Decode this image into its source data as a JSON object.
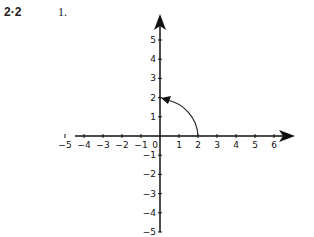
{
  "header": {
    "section": "2·2",
    "problem": "1."
  },
  "chart_data": {
    "type": "line",
    "title": "",
    "xlabel": "",
    "ylabel": "",
    "xlim": [
      -5,
      6
    ],
    "ylim": [
      -5,
      5
    ],
    "x_ticks": [
      -5,
      -4,
      -3,
      -2,
      -1,
      0,
      1,
      2,
      3,
      4,
      5,
      6
    ],
    "y_ticks": [
      -5,
      -4,
      -3,
      -2,
      -1,
      1,
      2,
      3,
      4,
      5
    ],
    "grid": false,
    "series": [
      {
        "name": "rotation arc",
        "description": "Counterclockwise 90° arc from (2,0) to (0,2) with arrowhead at (0,2)",
        "points": [
          [
            2,
            0
          ],
          [
            1.414,
            1.414
          ],
          [
            0,
            2
          ]
        ]
      }
    ]
  }
}
